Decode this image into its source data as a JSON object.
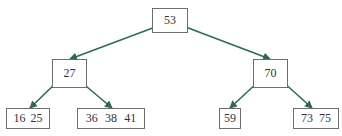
{
  "diagram": {
    "type": "btree",
    "colors": {
      "edge": "#2f6b4f",
      "border": "#6e6e6e",
      "text": "#333333"
    },
    "nodes": {
      "root": {
        "keys": [
          "53"
        ]
      },
      "left": {
        "keys": [
          "27"
        ]
      },
      "right": {
        "keys": [
          "70"
        ]
      },
      "leaf1": {
        "keys": [
          "16",
          "25"
        ]
      },
      "leaf2": {
        "keys": [
          "36",
          "38",
          "41"
        ]
      },
      "leaf3": {
        "keys": [
          "59"
        ]
      },
      "leaf4": {
        "keys": [
          "73",
          "75"
        ]
      }
    },
    "edges": [
      {
        "from": "root",
        "to": "left"
      },
      {
        "from": "root",
        "to": "right"
      },
      {
        "from": "left",
        "to": "leaf1"
      },
      {
        "from": "left",
        "to": "leaf2"
      },
      {
        "from": "right",
        "to": "leaf3"
      },
      {
        "from": "right",
        "to": "leaf4"
      }
    ]
  }
}
